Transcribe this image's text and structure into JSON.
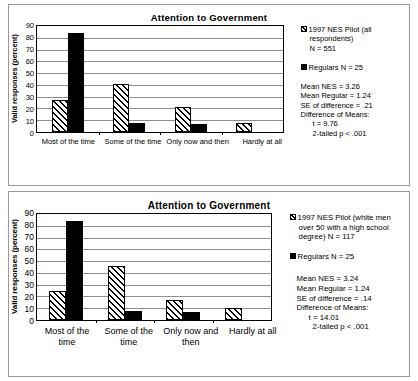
{
  "charts": [
    {
      "title": "Attention to Government",
      "ylabel": "Valid responses (percent)",
      "yticks": [
        "90",
        "80",
        "70",
        "60",
        "50",
        "40",
        "30",
        "20",
        "10",
        "0"
      ],
      "categories": [
        "Most of the time",
        "Some of the time",
        "Only now and then",
        "Hardly at all"
      ],
      "legend": {
        "series1_l1": "1997 NES Pilot (all",
        "series1_l2": "respondents)",
        "series1_l3": "N = 551",
        "series2": "Regulars N = 25"
      },
      "stats": {
        "mean_nes": "Mean NES = 3.26",
        "mean_regular": "Mean Regular = 1.24",
        "se": "SE of difference = .21",
        "diff_header": "Difference of Means:",
        "t": "t = 9.76",
        "p": "2-tailed p < .001"
      },
      "chart_data": {
        "type": "bar",
        "title": "Attention to Government",
        "xlabel": "",
        "ylabel": "Valid responses (percent)",
        "ylim": [
          0,
          90
        ],
        "ytick_step": 10,
        "grid": true,
        "legend_position": "right",
        "categories": [
          "Most of the time",
          "Some of the time",
          "Only now and then",
          "Hardly at all"
        ],
        "series": [
          {
            "name": "1997 NES Pilot (all respondents) N = 551",
            "pattern": "hatched",
            "values": [
              27,
              41,
              21,
              8
            ]
          },
          {
            "name": "Regulars N = 25",
            "pattern": "solid-black",
            "values": [
              84,
              8,
              7,
              0
            ]
          }
        ],
        "annotations": [
          "Mean NES = 3.26",
          "Mean Regular = 1.24",
          "SE of difference = .21",
          "Difference of Means:",
          "t = 9.76",
          "2-tailed p < .001"
        ]
      }
    },
    {
      "title": "Attention to Government",
      "ylabel": "Valid responses (percent)",
      "yticks": [
        "90",
        "80",
        "70",
        "60",
        "50",
        "40",
        "30",
        "20",
        "10",
        "0"
      ],
      "categories": [
        "Most of the time",
        "Some of the time",
        "Only now and then",
        "Hardly at all"
      ],
      "legend": {
        "series1_l1": "1997 NES Pilot  (white men",
        "series1_l2": "over 50 with a high school",
        "series1_l3": "degree) N = 117",
        "series2": "Regulars N = 25"
      },
      "stats": {
        "mean_nes": "Mean NES = 3.24",
        "mean_regular": "Mean Regular = 1.24",
        "se": "SE of difference = .14",
        "diff_header": "Difference of Means:",
        "t": "t = 14.01",
        "p": "2-tailed p < .001"
      },
      "chart_data": {
        "type": "bar",
        "title": "Attention to Government",
        "xlabel": "",
        "ylabel": "Valid responses (percent)",
        "ylim": [
          0,
          90
        ],
        "ytick_step": 10,
        "grid": true,
        "legend_position": "right",
        "categories": [
          "Most of the time",
          "Some of the time",
          "Only now and then",
          "Hardly at all"
        ],
        "series": [
          {
            "name": "1997 NES Pilot (white men over 50 with a high school degree) N = 117",
            "pattern": "hatched",
            "values": [
              25,
              46,
              17,
              10
            ]
          },
          {
            "name": "Regulars N = 25",
            "pattern": "solid-black",
            "values": [
              84,
              8,
              7,
              0
            ]
          }
        ],
        "annotations": [
          "Mean NES = 3.24",
          "Mean Regular = 1.24",
          "SE of difference = .14",
          "Difference of Means:",
          "t = 14.01",
          "2-tailed p < .001"
        ]
      }
    }
  ]
}
